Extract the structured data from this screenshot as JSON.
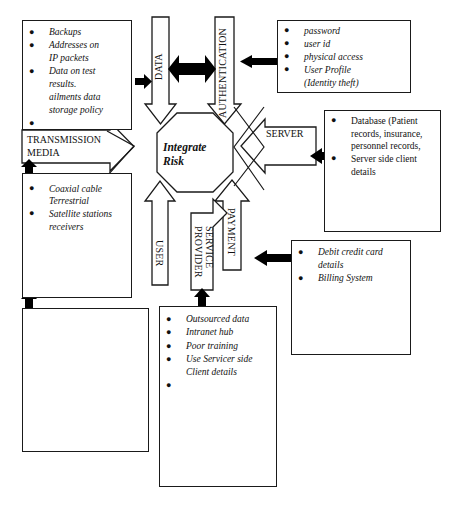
{
  "diagram": {
    "title": "Integrate Risk",
    "center": {
      "label": "Integrate\nRisk"
    },
    "channels": [
      {
        "name": "data",
        "label": "DATA"
      },
      {
        "name": "authentication",
        "label": "AUTHENTICATION"
      },
      {
        "name": "server",
        "label": "SERVER"
      },
      {
        "name": "transmission-media",
        "label": "TRANSMISSION\nMEDIA"
      },
      {
        "name": "user",
        "label": "USER"
      },
      {
        "name": "service-provider",
        "label": "SERVICE\nPROVIDER"
      },
      {
        "name": "payment",
        "label": "PAYMENT"
      }
    ],
    "boxes": {
      "data_risks": {
        "name": "data-risks-box",
        "style": "italic",
        "items": [
          "Backups",
          "Addresses on\nIP packets",
          "Data on test\nresults.\nailments data\nstorage policy",
          ""
        ]
      },
      "authentication_risks": {
        "name": "authentication-risks-box",
        "style": "italic",
        "items": [
          "password",
          "user id",
          "physical access",
          "User Profile\n(Identity theft)"
        ]
      },
      "server_risks": {
        "name": "server-risks-box",
        "style": "roman",
        "items": [
          "Database (Patient\nrecords, insurance,\npersonnel records,",
          "Server side client\ndetails"
        ]
      },
      "transmission_risks": {
        "name": "transmission-media-risks-box",
        "style": "italic",
        "items": [
          "Coaxial cable\nTerrestrial",
          "Satellite stations\nreceivers"
        ]
      },
      "payment_risks": {
        "name": "payment-risks-box",
        "style": "italic",
        "items": [
          "Debit credit card\ndetails",
          "Billing System"
        ]
      },
      "service_provider_risks": {
        "name": "service-provider-risks-box",
        "style": "italic",
        "items": [
          "Outsourced data",
          "Intranet hub",
          "Poor training",
          "Use Servicer side\nClient details",
          ""
        ]
      },
      "user_risks": {
        "name": "user-risks-box",
        "style": "italic",
        "items": []
      }
    },
    "colors": {
      "stroke": "#1a1a1a",
      "fill": "#ffffff",
      "solid_arrow": "#000000"
    }
  }
}
